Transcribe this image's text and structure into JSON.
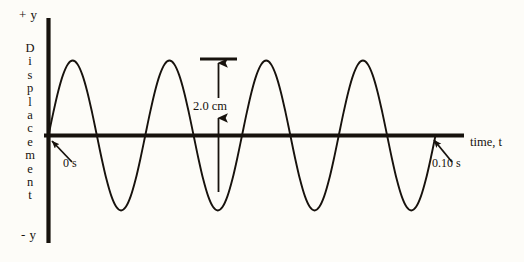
{
  "figure": {
    "background_color": "#fdfcf8",
    "ink_color": "#17120d",
    "axis_labels": {
      "positive_y": "+ y",
      "negative_y": "- y",
      "vertical_axis_title": "Displacement",
      "horizontal_axis_title": "time, t"
    },
    "annotations": {
      "start_time": "0 s",
      "end_time": "0.10 s",
      "amplitude_measure": "2.0 cm"
    }
  },
  "chart_data": {
    "type": "line",
    "title": "",
    "subtitle": "",
    "xlabel": "time, t",
    "ylabel": "Displacement",
    "xlim": [
      0,
      0.1
    ],
    "ylim": [
      -1.0,
      1.0
    ],
    "x_unit": "s",
    "y_unit": "cm",
    "grid": false,
    "legend": null,
    "xtick_labels": [
      "0 s",
      "0.10 s"
    ],
    "ytick_labels": [
      "+ y",
      "- y"
    ],
    "waveform": {
      "shape": "sine",
      "amplitude_cm": 1.0,
      "peak_to_peak_cm": 2.0,
      "cycles": 4,
      "period_s": 0.025,
      "frequency_hz": 40,
      "phase": "starts at zero rising",
      "duration_s": 0.1
    },
    "annotations": [
      {
        "name": "amplitude-annotation",
        "text": "2.0 cm",
        "kind": "double-headed-vertical-arrow",
        "measures": "crest-to-trough peak-to-peak displacement",
        "value": 2.0,
        "unit": "cm"
      },
      {
        "name": "start-time-annotation",
        "text": "0 s",
        "kind": "arrow-to-point",
        "points_to": "origin on time axis",
        "value": 0,
        "unit": "s"
      },
      {
        "name": "end-time-annotation",
        "text": "0.10 s",
        "kind": "arrow-to-point",
        "points_to": "end of waveform on time axis",
        "value": 0.1,
        "unit": "s"
      }
    ],
    "series": [
      {
        "name": "displacement",
        "x": [
          0.0,
          0.00125,
          0.0025,
          0.00375,
          0.005,
          0.00625,
          0.0075,
          0.00875,
          0.01,
          0.01125,
          0.0125,
          0.01375,
          0.015,
          0.01625,
          0.0175,
          0.01875,
          0.02,
          0.02125,
          0.0225,
          0.02375,
          0.025,
          0.02625,
          0.0275,
          0.02875,
          0.03,
          0.03125,
          0.0325,
          0.03375,
          0.035,
          0.03625,
          0.0375,
          0.03875,
          0.04,
          0.04125,
          0.0425,
          0.04375,
          0.045,
          0.04625,
          0.0475,
          0.04875,
          0.05,
          0.05125,
          0.0525,
          0.05375,
          0.055,
          0.05625,
          0.0575,
          0.05875,
          0.06,
          0.06125,
          0.0625,
          0.06375,
          0.065,
          0.06625,
          0.0675,
          0.06875,
          0.07,
          0.07125,
          0.0725,
          0.07375,
          0.075,
          0.07625,
          0.0775,
          0.07875,
          0.08,
          0.08125,
          0.0825,
          0.08375,
          0.085,
          0.08625,
          0.0875,
          0.08875,
          0.09,
          0.09125,
          0.0925,
          0.09375,
          0.095,
          0.09625,
          0.0975,
          0.09875,
          0.1
        ],
        "y": [
          0.0,
          0.309,
          0.588,
          0.809,
          0.951,
          1.0,
          0.951,
          0.809,
          0.588,
          0.309,
          0.0,
          -0.309,
          -0.588,
          -0.809,
          -0.951,
          -1.0,
          -0.951,
          -0.809,
          -0.588,
          -0.309,
          0.0,
          0.309,
          0.588,
          0.809,
          0.951,
          1.0,
          0.951,
          0.809,
          0.588,
          0.309,
          0.0,
          -0.309,
          -0.588,
          -0.809,
          -0.951,
          -1.0,
          -0.951,
          -0.809,
          -0.588,
          -0.309,
          0.0,
          0.309,
          0.588,
          0.809,
          0.951,
          1.0,
          0.951,
          0.809,
          0.588,
          0.309,
          0.0,
          -0.309,
          -0.588,
          -0.809,
          -0.951,
          -1.0,
          -0.951,
          -0.809,
          -0.588,
          -0.309,
          0.0,
          0.309,
          0.588,
          0.809,
          0.951,
          1.0,
          0.951,
          0.809,
          0.588,
          0.309,
          0.0,
          -0.309,
          -0.588,
          -0.809,
          -0.951,
          -1.0,
          -0.951,
          -0.809,
          -0.588,
          -0.309,
          0.0
        ]
      }
    ]
  }
}
